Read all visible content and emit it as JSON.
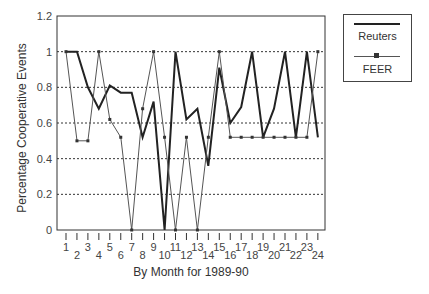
{
  "chart_data": {
    "type": "line",
    "title": "",
    "xlabel": "By Month for 1989-90",
    "ylabel": "Percentage Cooperative Events",
    "x": [
      1,
      2,
      3,
      4,
      5,
      6,
      7,
      8,
      9,
      10,
      11,
      12,
      13,
      14,
      15,
      16,
      17,
      18,
      19,
      20,
      21,
      22,
      23,
      24
    ],
    "categories": [
      "1",
      "2",
      "3",
      "4",
      "5",
      "6",
      "7",
      "8",
      "9",
      "10",
      "11",
      "12",
      "13",
      "14",
      "15",
      "16",
      "17",
      "18",
      "19",
      "20",
      "21",
      "22",
      "23",
      "24"
    ],
    "ylim": [
      0,
      1.2
    ],
    "yticks": [
      "0",
      "0.2",
      "0.4",
      "0.6",
      "0.8",
      "1",
      "1.2"
    ],
    "ytick_values": [
      0,
      0.2,
      0.4,
      0.6,
      0.8,
      1.0,
      1.2
    ],
    "grid": "horizontal dotted",
    "legend_position": "right, outside",
    "series": [
      {
        "name": "Reuters",
        "style": "thick line, no markers",
        "color": "#222222",
        "values": [
          1.0,
          1.0,
          0.8,
          0.68,
          0.81,
          0.77,
          0.77,
          0.52,
          0.72,
          0.0,
          1.0,
          0.62,
          0.68,
          0.36,
          0.91,
          0.6,
          0.69,
          1.0,
          0.52,
          0.68,
          1.0,
          0.52,
          1.0,
          0.52
        ]
      },
      {
        "name": "FEER",
        "style": "thin line, square markers",
        "color": "#555555",
        "values": [
          1.0,
          0.5,
          0.5,
          1.0,
          0.62,
          0.52,
          0.0,
          0.68,
          1.0,
          0.52,
          0.0,
          0.52,
          0.0,
          0.52,
          1.0,
          0.52,
          0.52,
          0.52,
          0.52,
          0.52,
          0.52,
          0.52,
          0.52,
          1.0
        ]
      }
    ]
  },
  "legend": {
    "items": [
      {
        "label": "Reuters"
      },
      {
        "label": "FEER"
      }
    ]
  }
}
